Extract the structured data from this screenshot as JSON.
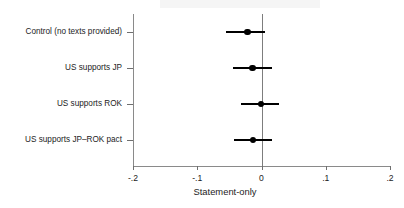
{
  "chart_data": {
    "type": "scatter",
    "title": "",
    "xlabel": "Statement-only",
    "ylabel": "",
    "xlim": [
      -0.2,
      0.2
    ],
    "xticks": [
      "-.2",
      "-.1",
      "0",
      ".1",
      ".2"
    ],
    "xtick_values": [
      -0.2,
      -0.1,
      0,
      0.1,
      0.2
    ],
    "grid": false,
    "legend": null,
    "reference_line": 0,
    "categories": [
      "Control (no texts provided)",
      "US supports JP",
      "US supports ROK",
      "US supports JP–ROK pact"
    ],
    "values": [
      -0.022,
      -0.014,
      -0.001,
      -0.013
    ],
    "ci_low": [
      -0.055,
      -0.044,
      -0.032,
      -0.043
    ],
    "ci_high": [
      0.006,
      0.016,
      0.028,
      0.017
    ],
    "points": [
      {
        "label": "Control (no texts provided)",
        "estimate": -0.022,
        "ci_low": -0.055,
        "ci_high": 0.006
      },
      {
        "label": "US supports JP",
        "estimate": -0.014,
        "ci_low": -0.044,
        "ci_high": 0.016
      },
      {
        "label": "US supports ROK",
        "estimate": -0.001,
        "ci_low": -0.032,
        "ci_high": 0.028
      },
      {
        "label": "US supports JP–ROK pact",
        "estimate": -0.013,
        "ci_low": -0.043,
        "ci_high": 0.017
      }
    ],
    "colors": {
      "marker": "#000000",
      "ci": "#000000",
      "axis": "#8a8a8a",
      "reference": "#7d7d7d",
      "text": "#1c1c1c",
      "background": "#ffffff"
    }
  }
}
